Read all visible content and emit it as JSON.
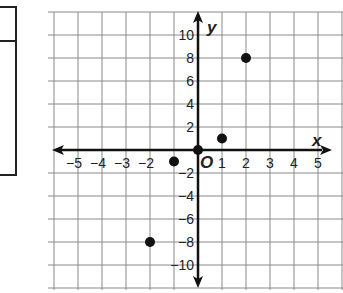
{
  "chart_data": {
    "type": "scatter",
    "title": "",
    "xlabel": "x",
    "ylabel": "y",
    "origin_label": "O",
    "xlim": [
      -6,
      6
    ],
    "ylim": [
      -12,
      12
    ],
    "grid": true,
    "x_ticks": [
      "-5",
      "-4",
      "-3",
      "-2",
      "1",
      "2",
      "3",
      "4",
      "5"
    ],
    "x_tick_values": [
      -5,
      -4,
      -3,
      -2,
      1,
      2,
      3,
      4,
      5
    ],
    "y_ticks": [
      "10",
      "8",
      "6",
      "4",
      "2",
      "-2",
      "-4",
      "-6",
      "-8",
      "-10"
    ],
    "y_tick_values": [
      10,
      8,
      6,
      4,
      2,
      -2,
      -4,
      -6,
      -8,
      -10
    ],
    "points": [
      {
        "x": -2,
        "y": -8
      },
      {
        "x": -1,
        "y": -1
      },
      {
        "x": 0,
        "y": 0
      },
      {
        "x": 1,
        "y": 1
      },
      {
        "x": 2,
        "y": 8
      }
    ]
  },
  "colors": {
    "grid": "#8a8a8a",
    "axis": "#111111",
    "point": "#111111",
    "table_border": "#222222"
  },
  "labels": {
    "x_axis": "x",
    "y_axis": "y",
    "origin": "O"
  }
}
